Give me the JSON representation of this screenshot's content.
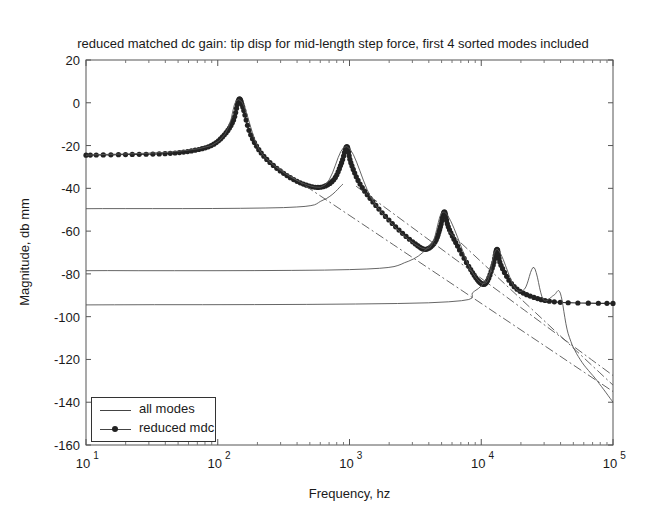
{
  "chart_data": {
    "type": "line",
    "title": "reduced matched dc gain:  tip disp for mid-length step force, first 4 sorted modes included",
    "xlabel": "Frequency, hz",
    "ylabel": "Magnitude, db mm",
    "xscale": "log",
    "xlim": [
      10,
      100000
    ],
    "ylim": [
      -160,
      20
    ],
    "x_ticks": [
      "10^1",
      "10^2",
      "10^3",
      "10^4",
      "10^5"
    ],
    "y_ticks": [
      20,
      0,
      -20,
      -40,
      -60,
      -80,
      -100,
      -120,
      -140,
      -160
    ],
    "grid": false,
    "legend_position": "lower left",
    "legend": [
      "all modes",
      "reduced mdc"
    ],
    "series": [
      {
        "name": "reduced mdc",
        "style": "line-with-dots",
        "points_log10f_db": [
          [
            1.0,
            -24.5
          ],
          [
            1.3,
            -24.2
          ],
          [
            1.6,
            -23.8
          ],
          [
            1.8,
            -22.5
          ],
          [
            1.95,
            -20
          ],
          [
            2.05,
            -15
          ],
          [
            2.12,
            -8
          ],
          [
            2.16,
            1.5
          ],
          [
            2.19,
            -2
          ],
          [
            2.25,
            -15
          ],
          [
            2.35,
            -25
          ],
          [
            2.5,
            -33
          ],
          [
            2.65,
            -38
          ],
          [
            2.78,
            -39.5
          ],
          [
            2.88,
            -36
          ],
          [
            2.94,
            -28
          ],
          [
            2.98,
            -20.5
          ],
          [
            3.01,
            -28
          ],
          [
            3.08,
            -38
          ],
          [
            3.2,
            -48
          ],
          [
            3.35,
            -58
          ],
          [
            3.5,
            -66
          ],
          [
            3.58,
            -68.5
          ],
          [
            3.65,
            -65
          ],
          [
            3.69,
            -58
          ],
          [
            3.72,
            -51
          ],
          [
            3.75,
            -58
          ],
          [
            3.82,
            -67
          ],
          [
            3.92,
            -78
          ],
          [
            3.99,
            -84
          ],
          [
            4.04,
            -84
          ],
          [
            4.09,
            -76
          ],
          [
            4.12,
            -68.5
          ],
          [
            4.15,
            -76
          ],
          [
            4.25,
            -86
          ],
          [
            4.4,
            -91
          ],
          [
            4.6,
            -93.3
          ],
          [
            5.0,
            -93.8
          ]
        ]
      },
      {
        "name": "all modes",
        "style": "thin-line",
        "points_log10f_db": [
          [
            1.0,
            -24.5
          ],
          [
            1.95,
            -20
          ],
          [
            2.16,
            1.5
          ],
          [
            2.35,
            -25
          ],
          [
            2.78,
            -39.5
          ],
          [
            2.98,
            -20.5
          ],
          [
            3.2,
            -48
          ],
          [
            3.58,
            -68.5
          ],
          [
            3.72,
            -51
          ],
          [
            3.92,
            -78
          ],
          [
            4.04,
            -84
          ],
          [
            4.12,
            -68.5
          ],
          [
            4.25,
            -86
          ],
          [
            4.33,
            -87
          ],
          [
            4.4,
            -77
          ],
          [
            4.47,
            -92
          ],
          [
            4.55,
            -90
          ],
          [
            4.6,
            -89
          ],
          [
            4.66,
            -108
          ],
          [
            4.75,
            -120
          ],
          [
            4.88,
            -130
          ],
          [
            5.0,
            -140
          ]
        ]
      },
      {
        "name": "mode-2 contribution",
        "style": "thin-line",
        "points_log10f_db": [
          [
            1.0,
            -49.5
          ],
          [
            2.5,
            -49
          ],
          [
            2.8,
            -45.5
          ],
          [
            2.95,
            -38
          ]
        ]
      },
      {
        "name": "mode-3 contribution",
        "style": "thin-line",
        "points_log10f_db": [
          [
            1.0,
            -78.5
          ],
          [
            3.0,
            -78
          ],
          [
            3.45,
            -74
          ],
          [
            3.65,
            -64
          ]
        ]
      },
      {
        "name": "mode-4 contribution",
        "style": "thin-line",
        "points_log10f_db": [
          [
            1.0,
            -94.5
          ],
          [
            3.6,
            -93.5
          ],
          [
            3.95,
            -88
          ],
          [
            4.08,
            -78
          ]
        ]
      },
      {
        "name": "mode-1 asymptote",
        "style": "dash-dot",
        "points_log10f_db": [
          [
            2.45,
            -30
          ],
          [
            5.0,
            -135
          ]
        ]
      },
      {
        "name": "mode-2 asymptote",
        "style": "dash-dot",
        "points_log10f_db": [
          [
            3.05,
            -39
          ],
          [
            5.0,
            -127.5
          ]
        ]
      },
      {
        "name": "mode-3 asymptote",
        "style": "dash-dot",
        "points_log10f_db": [
          [
            3.75,
            -60
          ],
          [
            5.0,
            -132
          ]
        ]
      }
    ],
    "annotations": []
  }
}
